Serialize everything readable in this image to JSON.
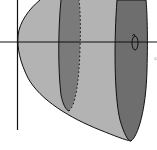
{
  "figure": {
    "type": "solid-of-revolution",
    "colors": {
      "background": "#ffffff",
      "solid": "#b3b3b3",
      "disk": "#7a7a7a",
      "stroke": "#111111"
    },
    "axes": {
      "x_axis_label": "",
      "y_axis_label": ""
    },
    "rotation_symbol": "↻",
    "edge_label": "x"
  }
}
